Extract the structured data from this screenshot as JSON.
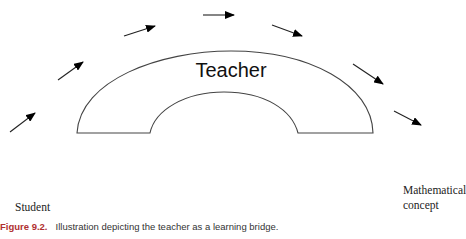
{
  "diagram": {
    "bridge_label": "Teacher",
    "left_label": "Student",
    "right_label_lines": [
      "Mathematical",
      "concept"
    ],
    "arrow_count": 7,
    "colors": {
      "stroke": "#333333",
      "arrowhead": "#000000",
      "figure_label": "#b03030"
    }
  },
  "caption": {
    "figure_number": "Figure 9.2.",
    "text": "Illustration depicting the teacher as a learning bridge."
  }
}
